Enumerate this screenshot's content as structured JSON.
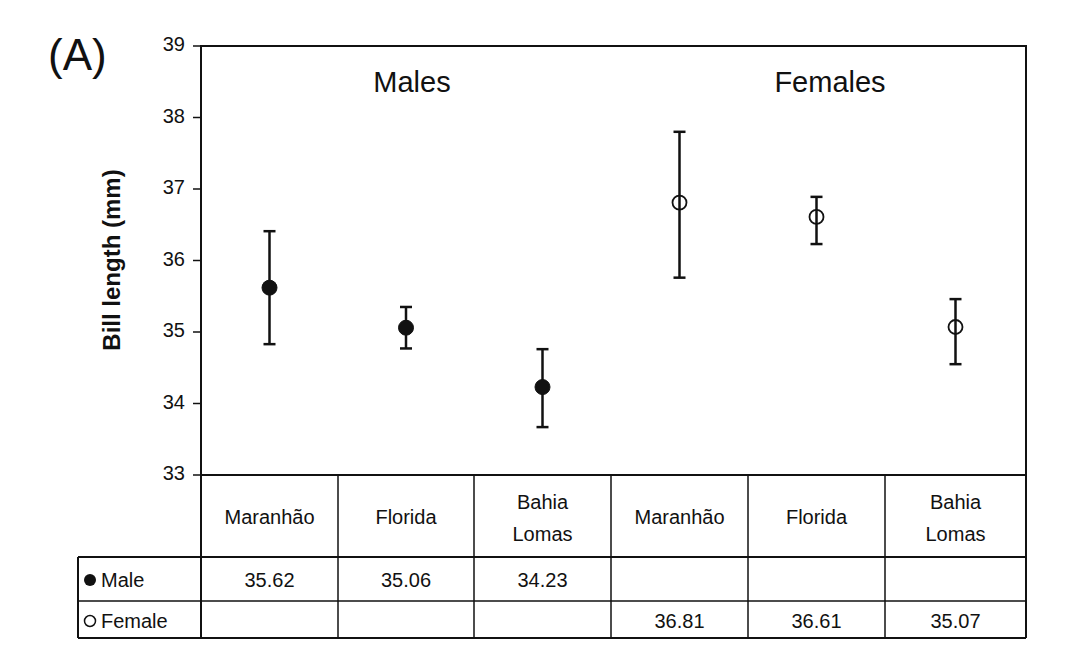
{
  "panel_label": "(A)",
  "group_titles": {
    "males": "Males",
    "females": "Females"
  },
  "chart_data": {
    "type": "scatter",
    "subtype": "point_with_error_bars",
    "title": "",
    "xlabel": "",
    "ylabel": "Bill length (mm)",
    "ylim": [
      33,
      39
    ],
    "yticks": [
      33,
      34,
      35,
      36,
      37,
      38,
      39
    ],
    "grid": false,
    "categories": [
      "Maranhão",
      "Florida",
      "Bahia Lomas",
      "Maranhão",
      "Florida",
      "Bahia Lomas"
    ],
    "category_labels": [
      "Maranhão",
      "Florida",
      "Bahia\nLomas",
      "Maranhão",
      "Florida",
      "Bahia\nLomas"
    ],
    "group_labels": [
      "Males",
      "Females"
    ],
    "series": [
      {
        "name": "Male",
        "marker": "filled-circle",
        "color": "#111111",
        "points": [
          {
            "category_index": 0,
            "label": "Maranhão",
            "value": 35.62,
            "upper": 36.41,
            "lower": 34.83
          },
          {
            "category_index": 1,
            "label": "Florida",
            "value": 35.06,
            "upper": 35.35,
            "lower": 34.77
          },
          {
            "category_index": 2,
            "label": "Bahia Lomas",
            "value": 34.23,
            "upper": 34.76,
            "lower": 33.67
          }
        ]
      },
      {
        "name": "Female",
        "marker": "open-circle",
        "color": "#111111",
        "points": [
          {
            "category_index": 3,
            "label": "Maranhão",
            "value": 36.81,
            "upper": 37.8,
            "lower": 35.76
          },
          {
            "category_index": 4,
            "label": "Florida",
            "value": 36.61,
            "upper": 36.89,
            "lower": 36.23
          },
          {
            "category_index": 5,
            "label": "Bahia Lomas",
            "value": 35.07,
            "upper": 35.46,
            "lower": 34.55
          }
        ]
      }
    ],
    "data_table": {
      "header": [
        "Maranhão",
        "Florida",
        "Bahia Lomas",
        "Maranhão",
        "Florida",
        "Bahia Lomas"
      ],
      "rows": [
        {
          "legend": "Male",
          "marker": "filled-circle",
          "values": [
            "35.62",
            "35.06",
            "34.23",
            "",
            "",
            ""
          ]
        },
        {
          "legend": "Female",
          "marker": "open-circle",
          "values": [
            "",
            "",
            "",
            "36.81",
            "36.61",
            "35.07"
          ]
        }
      ]
    }
  },
  "table": {
    "header": [
      {
        "line1": "Maranhão",
        "line2": ""
      },
      {
        "line1": "Florida",
        "line2": ""
      },
      {
        "line1": "Bahia",
        "line2": "Lomas"
      },
      {
        "line1": "Maranhão",
        "line2": ""
      },
      {
        "line1": "Florida",
        "line2": ""
      },
      {
        "line1": "Bahia",
        "line2": "Lomas"
      }
    ],
    "rows": [
      {
        "legend_symbol": "●",
        "legend_label": "Male",
        "values": [
          "35.62",
          "35.06",
          "34.23",
          "",
          "",
          ""
        ]
      },
      {
        "legend_symbol": "○",
        "legend_label": "Female",
        "values": [
          "",
          "",
          "",
          "36.81",
          "36.61",
          "35.07"
        ]
      }
    ]
  }
}
